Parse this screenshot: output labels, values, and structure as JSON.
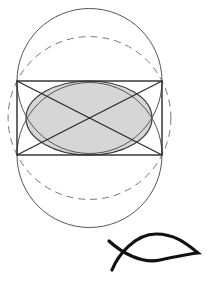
{
  "diagram": {
    "background": "#ffffff",
    "stroke_color": "#3a3a3a",
    "fill_color": "#d6d6d6",
    "rectangle": {
      "x": 17,
      "y": 81,
      "width": 145,
      "height": 74
    },
    "circles": [
      {
        "name": "top-circle",
        "cx": 89.5,
        "cy": 81,
        "r": 72.5,
        "style": "solid"
      },
      {
        "name": "bottom-circle",
        "cx": 89.5,
        "cy": 155,
        "r": 72.5,
        "style": "solid"
      },
      {
        "name": "circumscribed-circle",
        "cx": 89.5,
        "cy": 118,
        "r": 81.4,
        "style": "dashed"
      }
    ],
    "ellipse": {
      "cx": 89,
      "cy": 118,
      "rx": 63,
      "ry": 37
    },
    "symbol": {
      "name": "ichthys",
      "color": "#111111"
    }
  }
}
